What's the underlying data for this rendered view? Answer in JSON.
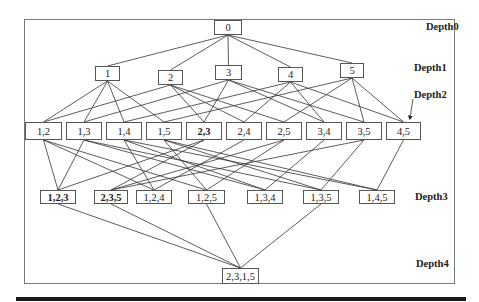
{
  "diagram": {
    "type": "itemset-lattice",
    "depth_labels": [
      {
        "id": "d0",
        "text": "Depth0",
        "x": 426,
        "y": 21
      },
      {
        "id": "d1",
        "text": "Depth1",
        "x": 414,
        "y": 62
      },
      {
        "id": "d2",
        "text": "Depth2",
        "x": 414,
        "y": 89
      },
      {
        "id": "d3",
        "text": "Depth3",
        "x": 415,
        "y": 191
      },
      {
        "id": "d4",
        "text": "Depth4",
        "x": 416,
        "y": 258
      }
    ],
    "nodes": [
      {
        "id": "0",
        "label": "0",
        "depth": 0,
        "x": 214,
        "y": 20,
        "w": 28,
        "h": 15,
        "bold": false
      },
      {
        "id": "1",
        "label": "1",
        "depth": 1,
        "x": 95,
        "y": 66,
        "w": 25,
        "h": 15,
        "bold": false
      },
      {
        "id": "2",
        "label": "2",
        "depth": 1,
        "x": 158,
        "y": 70,
        "w": 25,
        "h": 15,
        "bold": false
      },
      {
        "id": "3",
        "label": "3",
        "depth": 1,
        "x": 215,
        "y": 65,
        "w": 27,
        "h": 15,
        "bold": false
      },
      {
        "id": "4",
        "label": "4",
        "depth": 1,
        "x": 278,
        "y": 67,
        "w": 25,
        "h": 15,
        "bold": false
      },
      {
        "id": "5",
        "label": "5",
        "depth": 1,
        "x": 340,
        "y": 63,
        "w": 24,
        "h": 15,
        "bold": false
      },
      {
        "id": "12",
        "label": "1,2",
        "depth": 2,
        "x": 25,
        "y": 122,
        "w": 37,
        "h": 18,
        "bold": false
      },
      {
        "id": "13",
        "label": "1,3",
        "depth": 2,
        "x": 66,
        "y": 122,
        "w": 36,
        "h": 18,
        "bold": false
      },
      {
        "id": "14",
        "label": "1,4",
        "depth": 2,
        "x": 106,
        "y": 122,
        "w": 36,
        "h": 18,
        "bold": false
      },
      {
        "id": "15",
        "label": "1,5",
        "depth": 2,
        "x": 146,
        "y": 122,
        "w": 36,
        "h": 18,
        "bold": false
      },
      {
        "id": "23",
        "label": "2,3",
        "depth": 2,
        "x": 186,
        "y": 122,
        "w": 36,
        "h": 18,
        "bold": true
      },
      {
        "id": "24",
        "label": "2,4",
        "depth": 2,
        "x": 226,
        "y": 122,
        "w": 36,
        "h": 18,
        "bold": false
      },
      {
        "id": "25",
        "label": "2,5",
        "depth": 2,
        "x": 266,
        "y": 122,
        "w": 36,
        "h": 18,
        "bold": false
      },
      {
        "id": "34",
        "label": "3,4",
        "depth": 2,
        "x": 306,
        "y": 122,
        "w": 36,
        "h": 18,
        "bold": false
      },
      {
        "id": "35",
        "label": "3,5",
        "depth": 2,
        "x": 346,
        "y": 122,
        "w": 36,
        "h": 18,
        "bold": false
      },
      {
        "id": "45",
        "label": "4,5",
        "depth": 2,
        "x": 386,
        "y": 122,
        "w": 35,
        "h": 18,
        "bold": false
      },
      {
        "id": "123",
        "label": "1,2,3",
        "depth": 3,
        "x": 40,
        "y": 190,
        "w": 36,
        "h": 14,
        "bold": true
      },
      {
        "id": "235",
        "label": "2,3,5",
        "depth": 3,
        "x": 94,
        "y": 190,
        "w": 34,
        "h": 14,
        "bold": true
      },
      {
        "id": "124",
        "label": "1,2,4",
        "depth": 3,
        "x": 136,
        "y": 190,
        "w": 36,
        "h": 14,
        "bold": false
      },
      {
        "id": "125",
        "label": "1,2,5",
        "depth": 3,
        "x": 188,
        "y": 190,
        "w": 37,
        "h": 14,
        "bold": false
      },
      {
        "id": "134",
        "label": "1,3,4",
        "depth": 3,
        "x": 247,
        "y": 190,
        "w": 36,
        "h": 14,
        "bold": false
      },
      {
        "id": "135",
        "label": "1,3,5",
        "depth": 3,
        "x": 303,
        "y": 190,
        "w": 36,
        "h": 14,
        "bold": false
      },
      {
        "id": "145",
        "label": "1,4,5",
        "depth": 3,
        "x": 359,
        "y": 190,
        "w": 36,
        "h": 14,
        "bold": false
      },
      {
        "id": "2315",
        "label": "2,3,1,5",
        "depth": 4,
        "x": 222,
        "y": 268,
        "w": 37,
        "h": 16,
        "bold": false
      }
    ],
    "edges": [
      [
        "0",
        "1"
      ],
      [
        "0",
        "2"
      ],
      [
        "0",
        "3"
      ],
      [
        "0",
        "4"
      ],
      [
        "0",
        "5"
      ],
      [
        "1",
        "12"
      ],
      [
        "1",
        "13"
      ],
      [
        "1",
        "14"
      ],
      [
        "1",
        "15"
      ],
      [
        "2",
        "12"
      ],
      [
        "2",
        "23"
      ],
      [
        "2",
        "24"
      ],
      [
        "2",
        "25"
      ],
      [
        "3",
        "13"
      ],
      [
        "3",
        "23"
      ],
      [
        "3",
        "34"
      ],
      [
        "3",
        "35"
      ],
      [
        "4",
        "14"
      ],
      [
        "4",
        "24"
      ],
      [
        "4",
        "34"
      ],
      [
        "4",
        "45"
      ],
      [
        "5",
        "15"
      ],
      [
        "5",
        "25"
      ],
      [
        "5",
        "35"
      ],
      [
        "5",
        "45"
      ],
      [
        "12",
        "123"
      ],
      [
        "13",
        "123"
      ],
      [
        "23",
        "123"
      ],
      [
        "23",
        "235"
      ],
      [
        "25",
        "235"
      ],
      [
        "35",
        "235"
      ],
      [
        "12",
        "124"
      ],
      [
        "14",
        "124"
      ],
      [
        "24",
        "124"
      ],
      [
        "12",
        "125"
      ],
      [
        "15",
        "125"
      ],
      [
        "25",
        "125"
      ],
      [
        "13",
        "134"
      ],
      [
        "14",
        "134"
      ],
      [
        "34",
        "134"
      ],
      [
        "13",
        "135"
      ],
      [
        "15",
        "135"
      ],
      [
        "35",
        "135"
      ],
      [
        "14",
        "145"
      ],
      [
        "15",
        "145"
      ],
      [
        "45",
        "145"
      ],
      [
        "123",
        "2315"
      ],
      [
        "235",
        "2315"
      ],
      [
        "125",
        "2315"
      ],
      [
        "135",
        "2315"
      ]
    ],
    "arrow": {
      "from": [
        413,
        99
      ],
      "to": [
        410,
        118
      ],
      "target_label": "Depth2"
    }
  }
}
